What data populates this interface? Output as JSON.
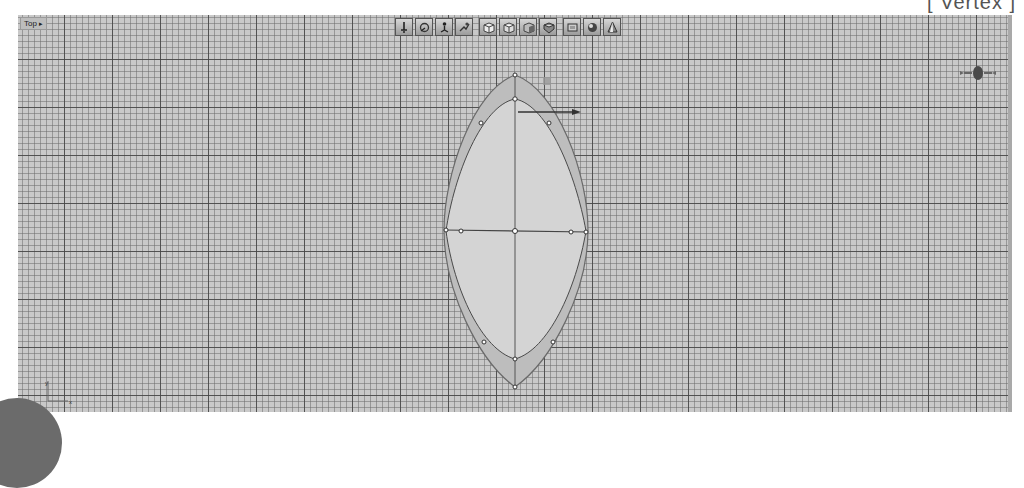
{
  "mode_label": "[ Vertex ]",
  "viewport": {
    "label": "Top",
    "label_dropdown_arrow": "▸",
    "background_color": "#c9c9c9",
    "grid": {
      "minor_spacing_px": 6,
      "major_spacing_px": 48
    }
  },
  "toolbar": {
    "groups": [
      {
        "buttons": [
          {
            "name": "select-move-icon"
          },
          {
            "name": "rotate-icon"
          },
          {
            "name": "scale-icon"
          },
          {
            "name": "snap-icon"
          }
        ]
      },
      {
        "buttons": [
          {
            "name": "cube-front-icon"
          },
          {
            "name": "cube-top-icon"
          },
          {
            "name": "cube-side-icon"
          },
          {
            "name": "cube-shaded-icon"
          }
        ]
      },
      {
        "buttons": [
          {
            "name": "viewport-frame-icon"
          },
          {
            "name": "sphere-shaded-icon"
          },
          {
            "name": "cone-shaded-icon"
          }
        ]
      }
    ]
  },
  "gizmo": {
    "x_arrow": "→"
  },
  "axis_tripod": {
    "x_label": "x",
    "y_label": "y"
  }
}
